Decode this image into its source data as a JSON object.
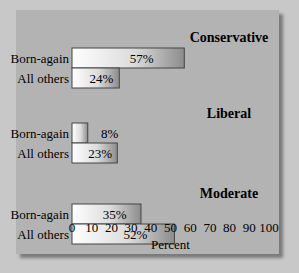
{
  "chart_data": {
    "type": "bar",
    "orientation": "horizontal",
    "xlabel": "Percent",
    "xlim": [
      0,
      100
    ],
    "xticks": [
      0,
      10,
      20,
      30,
      40,
      50,
      60,
      70,
      80,
      90,
      100
    ],
    "grid": false,
    "groups": [
      {
        "title": "Conservative",
        "categories": [
          "Born-again",
          "All others"
        ],
        "values": [
          57,
          24
        ],
        "labels": [
          "57%",
          "24%"
        ]
      },
      {
        "title": "Liberal",
        "categories": [
          "Born-again",
          "All others"
        ],
        "values": [
          8,
          23
        ],
        "labels": [
          "8%",
          "23%"
        ]
      },
      {
        "title": "Moderate",
        "categories": [
          "Born-again",
          "All others"
        ],
        "values": [
          35,
          52
        ],
        "labels": [
          "35%",
          "52%"
        ]
      }
    ]
  }
}
